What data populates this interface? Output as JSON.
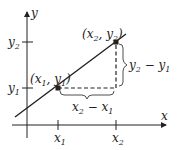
{
  "diagram": {
    "colors": {
      "ink": "#222222",
      "background": "#ffffff"
    },
    "axes": {
      "x_label": "x",
      "y_label": "y",
      "x_ticks": [
        {
          "base": "x",
          "sub": "1"
        },
        {
          "base": "x",
          "sub": "2"
        }
      ],
      "y_ticks": [
        {
          "base": "y",
          "sub": "1"
        },
        {
          "base": "y",
          "sub": "2"
        }
      ]
    },
    "points": [
      {
        "label_open": "(",
        "x_base": "x",
        "x_sub": "1",
        "sep": ", ",
        "y_base": "y",
        "y_sub": "1",
        "label_close": ")"
      },
      {
        "label_open": "(",
        "x_base": "x",
        "x_sub": "2",
        "sep": ", ",
        "y_base": "y",
        "y_sub": "2",
        "label_close": ")"
      }
    ],
    "annotations": {
      "run": {
        "a_base": "x",
        "a_sub": "2",
        "op": " − ",
        "b_base": "x",
        "b_sub": "1"
      },
      "rise": {
        "a_base": "y",
        "a_sub": "2",
        "op": " − ",
        "b_base": "y",
        "b_sub": "1"
      }
    }
  }
}
